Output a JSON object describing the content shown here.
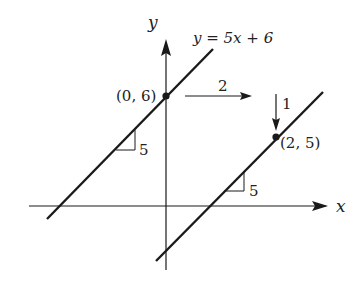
{
  "diagram": {
    "equation_label": "y = 5x + 6",
    "axis_labels": {
      "x": "x",
      "y": "y"
    },
    "points": [
      {
        "label": "(0, 6)",
        "x": 0,
        "y": 6
      },
      {
        "label": "(2, 5)",
        "x": 2,
        "y": 5
      }
    ],
    "run_label": "2",
    "drop_label": "1",
    "slope_labels": [
      "5",
      "5"
    ],
    "lines": [
      {
        "name": "y = 5x + 6",
        "slope": 5,
        "intercept": 6
      },
      {
        "name": "parallel line through (2,5)",
        "slope": 5,
        "point": [
          2,
          5
        ]
      }
    ],
    "colors": {
      "stroke": "#1a1a1a",
      "background": "#ffffff"
    }
  }
}
